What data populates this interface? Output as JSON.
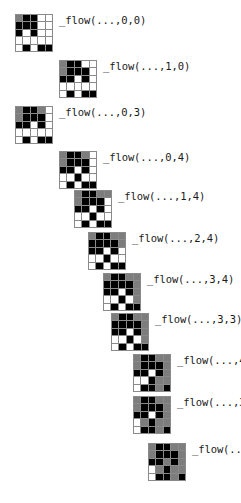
{
  "figure": {
    "kind": "grid-sequence",
    "background_color": "#ffffff",
    "grid_line_color": "#8a8a8a",
    "palette": {
      "white": "#ffffff",
      "gray": "#7d7d7d",
      "dark": "#3a3a3a",
      "black": "#000000"
    },
    "grid_rows": 5,
    "grid_cols": 5,
    "panel_count": 11
  },
  "panels": [
    {
      "label": "_flow(...,0,0)",
      "x": 15,
      "y": 14,
      "cells": [
        [
          "g",
          "k",
          "k",
          "w",
          "w"
        ],
        [
          "k",
          "k",
          "k",
          "w",
          "w"
        ],
        [
          "k",
          "w",
          "k",
          "w",
          "w"
        ],
        [
          "w",
          "w",
          "w",
          "w",
          "w"
        ],
        [
          "w",
          "k",
          "w",
          "k",
          "k"
        ]
      ]
    },
    {
      "label": "_flow(...,1,0)",
      "x": 59,
      "y": 60,
      "cells": [
        [
          "g",
          "k",
          "k",
          "w",
          "w"
        ],
        [
          "g",
          "k",
          "k",
          "k",
          "w"
        ],
        [
          "k",
          "k",
          "w",
          "k",
          "w"
        ],
        [
          "w",
          "w",
          "w",
          "w",
          "w"
        ],
        [
          "w",
          "k",
          "w",
          "k",
          "k"
        ]
      ]
    },
    {
      "label": "_flow(...,0,3)",
      "x": 15,
      "y": 106,
      "cells": [
        [
          "g",
          "k",
          "k",
          "g",
          "w"
        ],
        [
          "g",
          "k",
          "k",
          "k",
          "w"
        ],
        [
          "k",
          "k",
          "w",
          "k",
          "w"
        ],
        [
          "w",
          "w",
          "w",
          "w",
          "w"
        ],
        [
          "w",
          "k",
          "w",
          "k",
          "k"
        ]
      ]
    },
    {
      "label": "_flow(...,0,4)",
      "x": 59,
      "y": 151,
      "cells": [
        [
          "g",
          "k",
          "k",
          "g",
          "w"
        ],
        [
          "g",
          "k",
          "k",
          "k",
          "w"
        ],
        [
          "k",
          "k",
          "w",
          "k",
          "w"
        ],
        [
          "w",
          "w",
          "k",
          "w",
          "w"
        ],
        [
          "w",
          "k",
          "w",
          "k",
          "k"
        ]
      ]
    },
    {
      "label": "_flow(...,1,4)",
      "x": 74,
      "y": 190,
      "cells": [
        [
          "g",
          "k",
          "k",
          "g",
          "g"
        ],
        [
          "g",
          "k",
          "k",
          "k",
          "w"
        ],
        [
          "k",
          "k",
          "w",
          "k",
          "w"
        ],
        [
          "w",
          "w",
          "k",
          "w",
          "w"
        ],
        [
          "w",
          "k",
          "w",
          "k",
          "k"
        ]
      ]
    },
    {
      "label": "_flow(...,2,4)",
      "x": 88,
      "y": 232,
      "cells": [
        [
          "g",
          "k",
          "k",
          "g",
          "g"
        ],
        [
          "k",
          "k",
          "k",
          "k",
          "g"
        ],
        [
          "k",
          "k",
          "w",
          "k",
          "w"
        ],
        [
          "w",
          "w",
          "k",
          "w",
          "w"
        ],
        [
          "w",
          "k",
          "w",
          "k",
          "k"
        ]
      ]
    },
    {
      "label": "_flow(...,3,4)",
      "x": 103,
      "y": 273,
      "cells": [
        [
          "g",
          "k",
          "k",
          "g",
          "g"
        ],
        [
          "k",
          "k",
          "k",
          "k",
          "g"
        ],
        [
          "k",
          "k",
          "w",
          "k",
          "g"
        ],
        [
          "w",
          "w",
          "k",
          "w",
          "g"
        ],
        [
          "w",
          "k",
          "w",
          "k",
          "k"
        ]
      ]
    },
    {
      "label": "_flow(...,3,3)",
      "x": 111,
      "y": 313,
      "cells": [
        [
          "g",
          "k",
          "k",
          "g",
          "g"
        ],
        [
          "k",
          "k",
          "k",
          "k",
          "g"
        ],
        [
          "k",
          "k",
          "w",
          "k",
          "g"
        ],
        [
          "w",
          "w",
          "k",
          "w",
          "g"
        ],
        [
          "w",
          "k",
          "w",
          "k",
          "k"
        ]
      ]
    },
    {
      "label": "_flow(...,4,3)",
      "x": 133,
      "y": 354,
      "cells": [
        [
          "g",
          "k",
          "k",
          "g",
          "g"
        ],
        [
          "g",
          "k",
          "k",
          "k",
          "g"
        ],
        [
          "k",
          "k",
          "w",
          "k",
          "g"
        ],
        [
          "w",
          "w",
          "k",
          "g",
          "g"
        ],
        [
          "w",
          "k",
          "k",
          "g",
          "k"
        ]
      ]
    },
    {
      "label": "_flow(...,3,2)",
      "x": 133,
      "y": 396,
      "cells": [
        [
          "g",
          "k",
          "k",
          "g",
          "g"
        ],
        [
          "g",
          "k",
          "k",
          "k",
          "g"
        ],
        [
          "k",
          "k",
          "w",
          "k",
          "g"
        ],
        [
          "w",
          "g",
          "k",
          "g",
          "g"
        ],
        [
          "w",
          "k",
          "k",
          "g",
          "k"
        ]
      ]
    },
    {
      "label": "_flow(...,2,2)",
      "x": 148,
      "y": 443,
      "cells": [
        [
          "g",
          "k",
          "k",
          "g",
          "g"
        ],
        [
          "g",
          "k",
          "k",
          "k",
          "g"
        ],
        [
          "k",
          "k",
          "g",
          "k",
          "g"
        ],
        [
          "w",
          "g",
          "k",
          "g",
          "g"
        ],
        [
          "w",
          "k",
          "k",
          "g",
          "k"
        ]
      ]
    }
  ]
}
